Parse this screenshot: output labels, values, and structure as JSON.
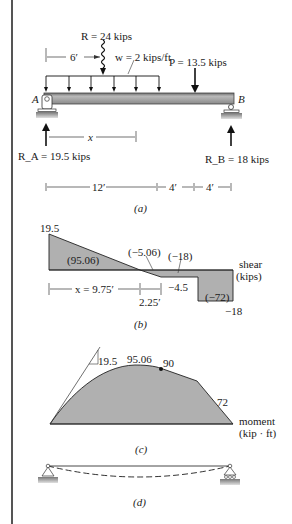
{
  "figure_a": {
    "caption": "(a)",
    "resultant_label": "R = 24 kips",
    "distributed_label": "w = 2 kips/ft",
    "point_load_label": "P = 13.5 kips",
    "dim_6": "6′",
    "support_a_label": "A",
    "support_b_label": "B",
    "x_label": "x",
    "reaction_a_label": "R_A = 19.5 kips",
    "reaction_b_label": "R_B = 18 kips",
    "dim_12": "12′",
    "dim_4a": "4′",
    "dim_4b": "4′"
  },
  "figure_b": {
    "caption": "(b)",
    "v_max": "19.5",
    "area_pos": "(95.06)",
    "area_neg_small": "(−5.06)",
    "area_neg_mid": "(−18)",
    "value_neg_45": "−4.5",
    "area_neg_big": "(−72)",
    "value_neg_18": "−18",
    "axis_label_line1": "shear",
    "axis_label_line2": "(kips)",
    "dim_x": "x = 9.75′",
    "dim_225": "2.25′"
  },
  "figure_c": {
    "caption": "(c)",
    "slope_label": "19.5",
    "max_label": "95.06",
    "point_label": "90",
    "right_label": "72",
    "axis_label_line1": "moment",
    "axis_label_line2": "(kip · ft)"
  },
  "figure_d": {
    "caption": "(d)"
  }
}
